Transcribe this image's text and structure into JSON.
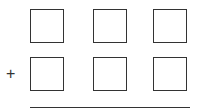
{
  "problem": {
    "type": "vertical-addition",
    "operator": "+",
    "rows": [
      {
        "digits": [
          "",
          "",
          ""
        ]
      },
      {
        "digits": [
          "",
          "",
          ""
        ]
      }
    ],
    "result": [
      "",
      "",
      ""
    ]
  },
  "colors": {
    "stroke": "#333333",
    "background": "#ffffff"
  }
}
